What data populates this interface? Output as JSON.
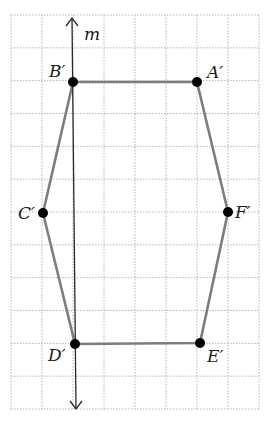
{
  "diagram": {
    "type": "reflected hexagon on grid",
    "grid": {
      "columns": 8,
      "rows": 12,
      "x_lines": [
        11,
        42,
        73,
        104,
        135,
        166,
        197,
        228,
        259
      ],
      "y_top": 15,
      "y_bottom": 409,
      "style": "dotted light gray"
    },
    "axis": {
      "label": "m",
      "from": [
        72,
        18
      ],
      "to": [
        76,
        409
      ],
      "arrows": "both ends"
    },
    "vertices": [
      {
        "name": "A′",
        "label": "A′",
        "x": 197,
        "y": 82
      },
      {
        "name": "B′",
        "label": "B′",
        "x": 73,
        "y": 82
      },
      {
        "name": "C′",
        "label": "C′",
        "x": 43,
        "y": 213
      },
      {
        "name": "D′",
        "label": "D′",
        "x": 75,
        "y": 344
      },
      {
        "name": "E′",
        "label": "E′",
        "x": 200,
        "y": 343
      },
      {
        "name": "F′",
        "label": "F′",
        "x": 228,
        "y": 212
      }
    ],
    "polygon_order": [
      "A′",
      "B′",
      "C′",
      "D′",
      "E′",
      "F′"
    ],
    "colors": {
      "edge": "#7d7d7d",
      "vertex": "#000000",
      "axis": "#2a2a2a",
      "grid": "#b5b5b5"
    }
  },
  "labels": {
    "axis": "m",
    "A": "A′",
    "B": "B′",
    "C": "C′",
    "D": "D′",
    "E": "E′",
    "F": "F′"
  }
}
